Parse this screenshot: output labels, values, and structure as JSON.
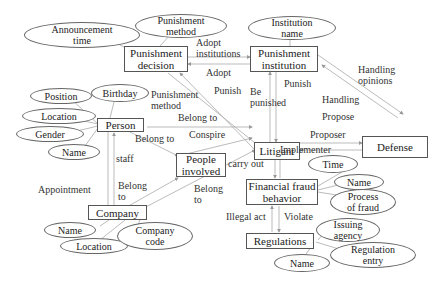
{
  "diagram": {
    "type": "entity-relationship",
    "entities": [
      {
        "id": "punishment_decision",
        "label": "Punishment\ndecision"
      },
      {
        "id": "punishment_institution",
        "label": "Punishment\ninstitution"
      },
      {
        "id": "person",
        "label": "Person"
      },
      {
        "id": "litigant",
        "label": "Litigant"
      },
      {
        "id": "defense",
        "label": "Defense"
      },
      {
        "id": "people_involved",
        "label": "People\ninvolved"
      },
      {
        "id": "financial_fraud_behavior",
        "label": "Financial fraud\nbehavior"
      },
      {
        "id": "company",
        "label": "Company"
      },
      {
        "id": "regulations",
        "label": "Regulations"
      }
    ],
    "attributes": [
      {
        "id": "announcement_time",
        "label": "Announcement\ntime",
        "of": "punishment_decision"
      },
      {
        "id": "punishment_method_attr",
        "label": "Punishment\nmethod",
        "of": "punishment_decision"
      },
      {
        "id": "institution_name",
        "label": "Institution\nname",
        "of": "punishment_institution"
      },
      {
        "id": "position",
        "label": "Position",
        "of": "person"
      },
      {
        "id": "birthday",
        "label": "Birthday",
        "of": "person"
      },
      {
        "id": "location_person",
        "label": "Location",
        "of": "person"
      },
      {
        "id": "gender",
        "label": "Gender",
        "of": "person"
      },
      {
        "id": "name_person",
        "label": "Name",
        "of": "person"
      },
      {
        "id": "time",
        "label": "Time",
        "of": "financial_fraud_behavior"
      },
      {
        "id": "name_fraud",
        "label": "Name",
        "of": "financial_fraud_behavior"
      },
      {
        "id": "process_of_fraud",
        "label": "Process\nof fraud",
        "of": "financial_fraud_behavior"
      },
      {
        "id": "issuing_agency",
        "label": "Issuing\nagency",
        "of": "regulations"
      },
      {
        "id": "regulation_entry",
        "label": "Regulation\nentry",
        "of": "regulations"
      },
      {
        "id": "name_regulations",
        "label": "Name",
        "of": "regulations"
      },
      {
        "id": "name_company",
        "label": "Name",
        "of": "company"
      },
      {
        "id": "location_company",
        "label": "Location",
        "of": "company"
      },
      {
        "id": "company_code",
        "label": "Company\ncode",
        "of": "company"
      }
    ],
    "relationships": [
      {
        "label": "Adopt\ninstitutions",
        "from": "punishment_decision",
        "to": "punishment_institution"
      },
      {
        "label": "Adopt",
        "from": "punishment_institution",
        "to": "punishment_decision"
      },
      {
        "label": "Punish",
        "from": "litigant",
        "to": "punishment_decision"
      },
      {
        "label": "Punishment\nmethod",
        "from": "person",
        "to": "litigant"
      },
      {
        "label": "Be\npunished",
        "from": "litigant",
        "to": "punishment_institution"
      },
      {
        "label": "Punish",
        "from": "punishment_institution",
        "to": "litigant"
      },
      {
        "label": "Handling\nopinions",
        "from": "punishment_institution",
        "to": "defense"
      },
      {
        "label": "Handling",
        "from": "defense",
        "to": "punishment_institution"
      },
      {
        "label": "Propose",
        "from": "litigant",
        "to": "defense"
      },
      {
        "label": "Proposer",
        "from": "defense",
        "to": "litigant"
      },
      {
        "label": "Belong to",
        "from": "person",
        "to": "litigant"
      },
      {
        "label": "Belong to",
        "from": "person",
        "to": "people_involved"
      },
      {
        "label": "Conspire",
        "from": "people_involved",
        "to": "litigant"
      },
      {
        "label": "staff",
        "from": "company",
        "to": "person"
      },
      {
        "label": "Appointment",
        "from": "person",
        "to": "company"
      },
      {
        "label": "Belong\nto",
        "from": "company",
        "to": "people_involved"
      },
      {
        "label": "Belong\nto",
        "from": "company",
        "to": "litigant"
      },
      {
        "label": "carry out",
        "from": "litigant",
        "to": "financial_fraud_behavior"
      },
      {
        "label": "Implementer",
        "from": "financial_fraud_behavior",
        "to": "litigant"
      },
      {
        "label": "Illegal act",
        "from": "regulations",
        "to": "financial_fraud_behavior"
      },
      {
        "label": "Violate",
        "from": "financial_fraud_behavior",
        "to": "regulations"
      }
    ],
    "colors": {
      "line": "#999999",
      "box_border": "#555555",
      "text": "#222222",
      "background": "#ffffff"
    }
  }
}
